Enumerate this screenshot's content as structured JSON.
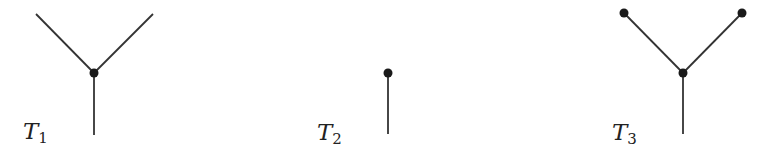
{
  "figure": {
    "stroke_color": "#333333",
    "node_color": "#1a1a1a",
    "trees": [
      {
        "id": "T1",
        "label": "T",
        "subscript": "1",
        "edges": [
          {
            "x1": 36,
            "y1": 14,
            "x2": 94,
            "y2": 73
          },
          {
            "x1": 153,
            "y1": 14,
            "x2": 94,
            "y2": 73
          },
          {
            "x1": 94,
            "y1": 73,
            "x2": 94,
            "y2": 135
          }
        ],
        "nodes": [
          {
            "cx": 94,
            "cy": 73
          }
        ]
      },
      {
        "id": "T2",
        "label": "T",
        "subscript": "2",
        "edges": [
          {
            "x1": 388,
            "y1": 73,
            "x2": 388,
            "y2": 134
          }
        ],
        "nodes": [
          {
            "cx": 388,
            "cy": 73
          }
        ]
      },
      {
        "id": "T3",
        "label": "T",
        "subscript": "3",
        "edges": [
          {
            "x1": 624,
            "y1": 13,
            "x2": 683,
            "y2": 73
          },
          {
            "x1": 742,
            "y1": 13,
            "x2": 683,
            "y2": 73
          },
          {
            "x1": 683,
            "y1": 73,
            "x2": 683,
            "y2": 134
          }
        ],
        "nodes": [
          {
            "cx": 624,
            "cy": 13
          },
          {
            "cx": 742,
            "cy": 13
          },
          {
            "cx": 683,
            "cy": 73
          }
        ]
      }
    ]
  }
}
